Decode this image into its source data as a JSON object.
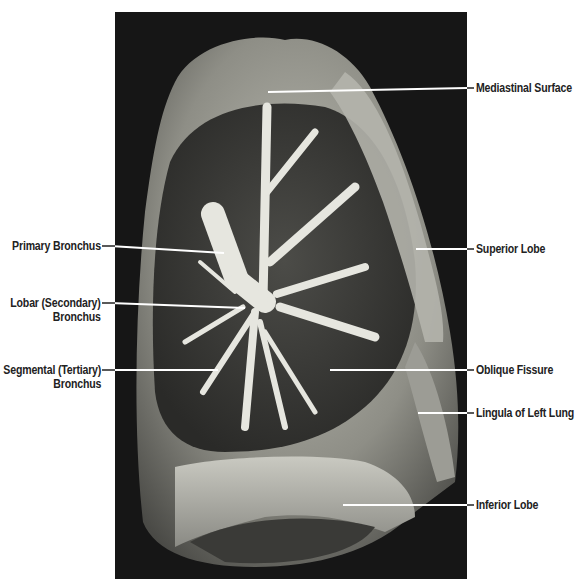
{
  "figure": {
    "note": "Stylized SVG approximation of the specimen photograph; the original raster image is not reproduced",
    "background_color": "#161616",
    "label_color": "#222222",
    "leader_color": "#ffffff"
  },
  "labels_left": [
    {
      "id": "primary-bronchus",
      "lines": [
        "Primary Bronchus"
      ]
    },
    {
      "id": "lobar-bronchus",
      "lines": [
        "Lobar (Secondary)",
        "Bronchus"
      ]
    },
    {
      "id": "segmental-bronchus",
      "lines": [
        "Segmental (Tertiary)",
        "Bronchus"
      ]
    }
  ],
  "labels_right": [
    {
      "id": "mediastinal-surface",
      "lines": [
        "Mediastinal Surface"
      ]
    },
    {
      "id": "superior-lobe",
      "lines": [
        "Superior Lobe"
      ]
    },
    {
      "id": "oblique-fissure",
      "lines": [
        "Oblique Fissure"
      ]
    },
    {
      "id": "lingula",
      "lines": [
        "Lingula of Left Lung"
      ]
    },
    {
      "id": "inferior-lobe",
      "lines": [
        "Inferior Lobe"
      ]
    }
  ]
}
